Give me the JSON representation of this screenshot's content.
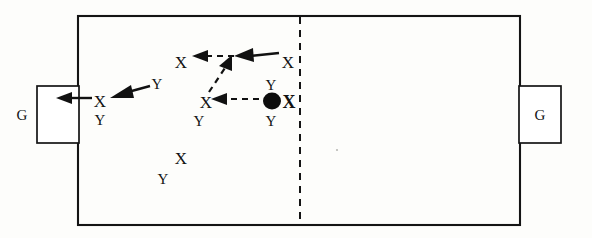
{
  "diagram": {
    "field": {
      "left": 78,
      "top": 16,
      "right": 520,
      "bottom": 225,
      "halfway_line_x": 300,
      "halfway_line_style": "dashed"
    },
    "goals": [
      {
        "name": "left-goal",
        "label": "G",
        "x": 37,
        "y": 86,
        "width": 42,
        "height": 56,
        "label_x": 28,
        "label_y": 120
      },
      {
        "name": "right-goal",
        "label": "G",
        "x": 520,
        "y": 86,
        "width": 42,
        "height": 56,
        "label_x": 538,
        "label_y": 120
      }
    ],
    "players": [
      {
        "id": "x1",
        "label": "X",
        "team": "X",
        "x": 100,
        "y": 101
      },
      {
        "id": "y1",
        "label": "Y",
        "team": "Y",
        "x": 100,
        "y": 119
      },
      {
        "id": "y2",
        "label": "Y",
        "team": "Y",
        "x": 157,
        "y": 83
      },
      {
        "id": "x2",
        "label": "X",
        "team": "X",
        "x": 181,
        "y": 62
      },
      {
        "id": "x3",
        "label": "X",
        "team": "X",
        "x": 288,
        "y": 62
      },
      {
        "id": "x4",
        "label": "X",
        "team": "X",
        "x": 206,
        "y": 102
      },
      {
        "id": "y3",
        "label": "Y",
        "team": "Y",
        "x": 199,
        "y": 120
      },
      {
        "id": "y4",
        "label": "Y",
        "team": "Y",
        "x": 271,
        "y": 84
      },
      {
        "id": "x5",
        "label": "X",
        "team": "X",
        "x": 289,
        "y": 102,
        "has_ball": true
      },
      {
        "id": "y5",
        "label": "Y",
        "team": "Y",
        "x": 271,
        "y": 120
      },
      {
        "id": "x6",
        "label": "X",
        "team": "X",
        "x": 181,
        "y": 158
      },
      {
        "id": "y6",
        "label": "Y",
        "team": "Y",
        "x": 163,
        "y": 178
      }
    ],
    "ball": {
      "name": "ball",
      "x": 272,
      "y": 101,
      "radius": 8
    },
    "passes": [
      {
        "id": "pass-1",
        "from": "x5",
        "to": "x4",
        "style": "dashed",
        "x1": 258,
        "y1": 99,
        "x2": 216,
        "y2": 99
      },
      {
        "id": "pass-2",
        "from": "x4",
        "to": "x2-run-point",
        "style": "dashed",
        "x1": 210,
        "y1": 92,
        "x2": 228,
        "y2": 62
      },
      {
        "id": "pass-3",
        "from": "junction",
        "to": "x2",
        "style": "dashed",
        "x1": 236,
        "y1": 56,
        "x2": 192,
        "y2": 56
      }
    ],
    "runs": [
      {
        "id": "run-1",
        "from": "x3",
        "to": "junction",
        "style": "solid",
        "x1": 278,
        "y1": 54,
        "x2": 232,
        "y2": 60
      },
      {
        "id": "run-2",
        "from": "y2",
        "to": "x1",
        "style": "solid",
        "x1": 150,
        "y1": 86,
        "x2": 112,
        "y2": 96
      },
      {
        "id": "run-3",
        "from": "x1",
        "to": "left-goal",
        "style": "solid",
        "x1": 94,
        "y1": 99,
        "x2": 58,
        "y2": 99
      }
    ],
    "legend": {
      "x_meaning": "X",
      "y_meaning": "Y",
      "goal_meaning": "G",
      "ball_meaning": "ball"
    }
  }
}
